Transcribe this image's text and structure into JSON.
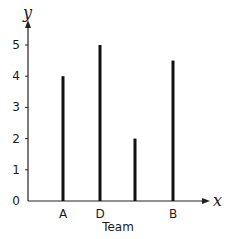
{
  "chart_data": {
    "type": "bar",
    "style": "stick",
    "title": "",
    "xlabel": "Team",
    "ylabel": "",
    "x_axis_variable": "x",
    "y_axis_variable": "y",
    "categories": [
      "A",
      "D",
      "",
      "B"
    ],
    "values": [
      4,
      5,
      2,
      4.5
    ],
    "yticks": [
      0,
      1,
      2,
      3,
      4,
      5
    ],
    "ylim": [
      0,
      5.5
    ],
    "grid": false,
    "legend": null,
    "bar_color": "#111111"
  }
}
